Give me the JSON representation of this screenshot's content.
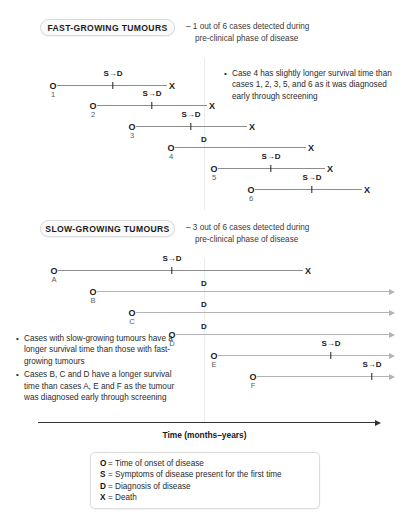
{
  "sections": [
    {
      "badge": "FAST-GROWING TUMOURS",
      "note_line1": "– 1 out of 6 cases detected during",
      "note_line2": "pre-clinical phase of disease",
      "cases": [
        {
          "label": "1",
          "onset": "O",
          "death": "X",
          "marker": "S→D",
          "marker_type": "sd",
          "open_ended": false
        },
        {
          "label": "2",
          "onset": "O",
          "death": "X",
          "marker": "S→D",
          "marker_type": "sd",
          "open_ended": false
        },
        {
          "label": "3",
          "onset": "O",
          "death": "X",
          "marker": "S→D",
          "marker_type": "sd",
          "open_ended": false
        },
        {
          "label": "4",
          "onset": "O",
          "death": "X",
          "marker": "D",
          "marker_type": "d",
          "open_ended": false
        },
        {
          "label": "5",
          "onset": "O",
          "death": "X",
          "marker": "S→D",
          "marker_type": "sd",
          "open_ended": false
        },
        {
          "label": "6",
          "onset": "O",
          "death": "X",
          "marker": "S→D",
          "marker_type": "sd",
          "open_ended": false
        }
      ],
      "bullets": [
        "Case 4 has slightly longer survival time than cases 1, 2, 3, 5, and 6 as it was diagnosed early through screening"
      ]
    },
    {
      "badge": "SLOW-GROWING TUMOURS",
      "note_line1": "– 3 out of 6 cases detected during",
      "note_line2": "pre-clinical phase of disease",
      "cases": [
        {
          "label": "A",
          "onset": "O",
          "death": "X",
          "marker": "S→D",
          "marker_type": "sd",
          "open_ended": false
        },
        {
          "label": "B",
          "onset": "O",
          "death": "",
          "marker": "D",
          "marker_type": "d",
          "open_ended": true
        },
        {
          "label": "C",
          "onset": "O",
          "death": "",
          "marker": "D",
          "marker_type": "d",
          "open_ended": true
        },
        {
          "label": "D",
          "onset": "O",
          "death": "",
          "marker": "D",
          "marker_type": "d",
          "open_ended": true
        },
        {
          "label": "E",
          "onset": "O",
          "death": "",
          "marker": "S→D",
          "marker_type": "sd",
          "open_ended": true
        },
        {
          "label": "F",
          "onset": "O",
          "death": "",
          "marker": "S→D",
          "marker_type": "sd",
          "open_ended": true
        }
      ],
      "bullets": [
        "Cases with slow-growing tumours have a longer survival time than those with fast-growing tumours",
        "Cases B, C and D have a longer survival time than cases A, E and F as the tumour was diagnosed early through screening"
      ]
    }
  ],
  "axis": {
    "label": "Time (months–years)"
  },
  "legend": [
    {
      "symbol": "O",
      "eq": "=",
      "text": "Time of onset of disease"
    },
    {
      "symbol": "S",
      "eq": "=",
      "text": "Symptoms of disease present for the first time"
    },
    {
      "symbol": "D",
      "eq": "=",
      "text": "Diagnosis of disease"
    },
    {
      "symbol": "X",
      "eq": "=",
      "text": "Death"
    }
  ],
  "colors": {
    "line": "#8d8d8d",
    "line_open": "#b4b4b4",
    "text": "#2b2b2b",
    "axis": "#333333",
    "screenline": "#ececec"
  }
}
